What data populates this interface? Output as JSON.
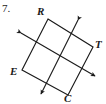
{
  "figure": {
    "problem_number": "7.",
    "stroke_color": "#1a1a1a",
    "background_color": "#ffffff",
    "labels": {
      "top": "R",
      "right": "T",
      "left": "E",
      "bottom": "C"
    }
  },
  "chart_data": {
    "type": "diagram",
    "title": "",
    "shape": "square",
    "vertices": [
      {
        "label": "R",
        "x": 48,
        "y": 19
      },
      {
        "label": "T",
        "x": 93,
        "y": 47
      },
      {
        "label": "C",
        "x": 68,
        "y": 95
      },
      {
        "label": "E",
        "x": 22,
        "y": 70
      }
    ],
    "square_edges": [
      {
        "from": "R",
        "to": "T"
      },
      {
        "from": "T",
        "to": "C"
      },
      {
        "from": "C",
        "to": "E"
      },
      {
        "from": "E",
        "to": "R"
      }
    ],
    "midpoints": [
      {
        "name": "mid-RT",
        "x": 70.5,
        "y": 33
      },
      {
        "name": "mid-TC",
        "x": 80.5,
        "y": 71
      },
      {
        "name": "mid-CE",
        "x": 45,
        "y": 82.5
      },
      {
        "name": "mid-ER",
        "x": 35,
        "y": 44.5
      }
    ],
    "arrow_lines": [
      {
        "name": "line-RT-to-CE",
        "through": [
          "mid-RT",
          "mid-CE"
        ],
        "x1": 78,
        "y1": 20,
        "x2": 41,
        "y2": 94,
        "double_headed": true
      },
      {
        "name": "line-ER-to-TC",
        "through": [
          "mid-ER",
          "mid-TC"
        ],
        "x1": 21,
        "y1": 33,
        "x2": 95,
        "y2": 76,
        "double_headed": true
      }
    ],
    "axis_ranges": {
      "x": [
        0,
        106
      ],
      "y": [
        0,
        104
      ]
    },
    "grid": false,
    "legend": false
  }
}
